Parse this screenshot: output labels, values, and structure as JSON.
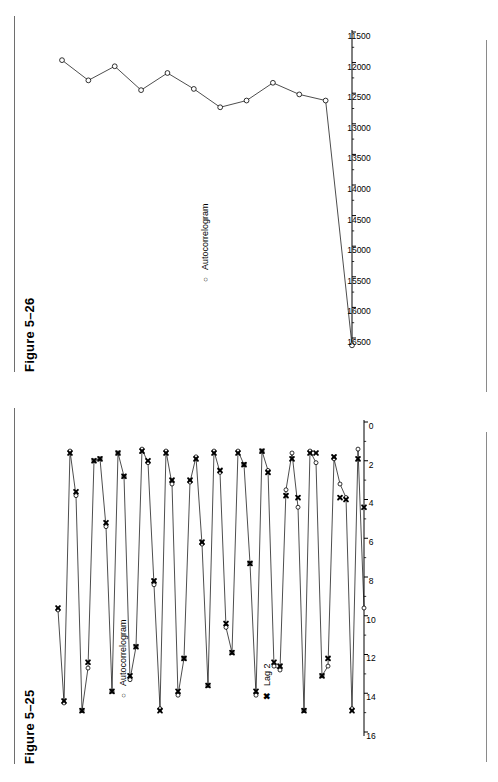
{
  "page": {
    "width": 498,
    "height": 782,
    "background": "#ffffff",
    "ink": "#000000"
  },
  "figures": [
    {
      "id": "figure-5-26",
      "title": "Figure 5–26",
      "legend": [
        {
          "key": "o",
          "key_name": "circle-marker",
          "label": "Autocorrelogram"
        }
      ],
      "chart_data": {
        "type": "line",
        "title": "Figure 5–26",
        "xlabel": "",
        "ylabel": "",
        "grid": false,
        "legend_position": "inside-upper-left",
        "legend": [
          "Autocorrelogram"
        ],
        "orientation": "value-axis-horizontal",
        "axis_ticks": [
          16500,
          16000,
          15500,
          15000,
          14500,
          14000,
          13500,
          13000,
          12500,
          12000,
          11500
        ],
        "axis_range": [
          11500,
          16500
        ],
        "series": [
          {
            "name": "Autocorrelogram",
            "marker": "open-circle",
            "values": [
              16620,
              12620,
              12520,
              12330,
              12620,
              12730,
              12430,
              12170,
              12450,
              12060,
              12290,
              11960
            ]
          }
        ]
      }
    },
    {
      "id": "figure-5-25",
      "title": "Figure 5–25",
      "legend": [
        {
          "key": "o",
          "key_name": "circle-marker",
          "label": "Autocorrelogram"
        },
        {
          "key": "x",
          "key_name": "cross-marker",
          "label": "Lag 2"
        }
      ],
      "chart_data": {
        "type": "line",
        "title": "Figure 5–25",
        "xlabel": "",
        "ylabel": "",
        "grid": false,
        "legend_position": "inside-upper-left",
        "legend": [
          "Autocorrelogram",
          "Lag 2"
        ],
        "orientation": "value-axis-horizontal",
        "axis_ticks": [
          16,
          14,
          12,
          10,
          8,
          6,
          4,
          2,
          0
        ],
        "axis_range": [
          0,
          16
        ],
        "series": [
          {
            "name": "Autocorrelogram",
            "marker": "open-circle",
            "values": [
              9.6,
              1.4,
              14.8,
              3.9,
              3.2,
              1.9,
              12.6,
              13.1,
              2.1,
              1.5,
              14.9,
              4.4,
              1.6,
              3.5,
              12.8,
              12.6,
              2.5,
              1.5,
              14.1,
              7.3,
              2.2,
              1.5,
              11.9,
              10.6,
              2.6,
              1.5,
              13.6,
              6.3,
              1.8,
              3.1,
              12.2,
              14.1,
              3.2,
              1.5,
              14.8,
              8.4,
              2.1,
              1.4,
              11.6,
              13.3,
              2.8,
              1.6,
              13.9,
              5.4,
              1.9,
              2.0,
              12.7,
              14.9,
              3.8,
              1.5,
              14.5,
              9.7
            ]
          },
          {
            "name": "Lag 2",
            "marker": "filled-cross",
            "values": [
              4.4,
              1.9,
              14.9,
              4.0,
              3.9,
              1.8,
              12.2,
              13.1,
              1.6,
              1.6,
              14.9,
              3.9,
              1.9,
              3.8,
              12.6,
              12.4,
              2.6,
              1.5,
              13.9,
              7.3,
              2.2,
              1.6,
              11.9,
              10.4,
              2.5,
              1.6,
              13.6,
              6.2,
              1.9,
              3.0,
              12.2,
              13.9,
              3.0,
              1.6,
              14.9,
              8.2,
              2.0,
              1.5,
              11.6,
              13.1,
              2.8,
              1.6,
              13.9,
              5.2,
              1.9,
              2.0,
              12.4,
              14.9,
              3.6,
              1.6,
              14.4,
              9.6
            ]
          }
        ]
      }
    }
  ]
}
